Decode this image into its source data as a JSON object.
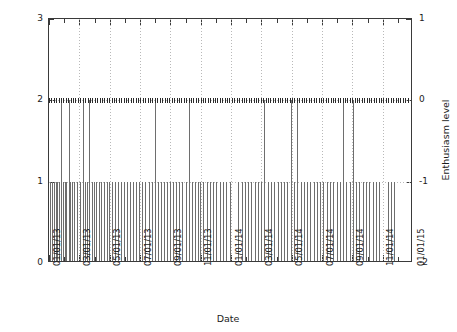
{
  "chart_data": {
    "type": "bar",
    "title": "",
    "subtitle": "",
    "xlabel": "Date",
    "ylabel": "Frequency",
    "y2label": "Enthusiasm level",
    "grid": "vertical dotted at major x ticks, dotted horizontal at y=1 and y=2",
    "legend": "none",
    "legend_position": "none",
    "xlim": [
      "01/01/13",
      "01/01/15"
    ],
    "ylim": [
      0,
      3
    ],
    "y2lim": [
      -2,
      1
    ],
    "yticks": [
      "0",
      "1",
      "2",
      "3"
    ],
    "y2ticks": [
      "-2",
      "-1",
      "0",
      "1"
    ],
    "xticks": [
      "01/01/13",
      "03/01/13",
      "05/01/13",
      "07/01/13",
      "09/01/13",
      "11/01/13",
      "01/01/14",
      "03/01/14",
      "05/01/14",
      "07/01/14",
      "09/01/14",
      "11/01/14",
      "01/01/15"
    ],
    "x_minor_tick_interval_months": 1,
    "x_major_tick_interval_months": 2,
    "series": [
      {
        "name": "Frequency",
        "style": "impulses",
        "color": "#6e6e6e",
        "note": "Vertical impulse for each dated event; height is 1 for most dates, 2 for repeat dates.",
        "x_fraction_and_value": [
          [
            0.003,
            1
          ],
          [
            0.008,
            1
          ],
          [
            0.013,
            1
          ],
          [
            0.018,
            1
          ],
          [
            0.023,
            1
          ],
          [
            0.028,
            1
          ],
          [
            0.033,
            2
          ],
          [
            0.038,
            1
          ],
          [
            0.043,
            1
          ],
          [
            0.048,
            1
          ],
          [
            0.054,
            2
          ],
          [
            0.059,
            1
          ],
          [
            0.064,
            1
          ],
          [
            0.069,
            1
          ],
          [
            0.078,
            1
          ],
          [
            0.086,
            1
          ],
          [
            0.093,
            2
          ],
          [
            0.099,
            1
          ],
          [
            0.105,
            1
          ],
          [
            0.111,
            2
          ],
          [
            0.117,
            1
          ],
          [
            0.123,
            1
          ],
          [
            0.129,
            1
          ],
          [
            0.136,
            1
          ],
          [
            0.143,
            1
          ],
          [
            0.15,
            1
          ],
          [
            0.158,
            1
          ],
          [
            0.166,
            1
          ],
          [
            0.174,
            1
          ],
          [
            0.182,
            1
          ],
          [
            0.19,
            1
          ],
          [
            0.198,
            1
          ],
          [
            0.206,
            1
          ],
          [
            0.214,
            1
          ],
          [
            0.222,
            1
          ],
          [
            0.23,
            1
          ],
          [
            0.238,
            1
          ],
          [
            0.247,
            1
          ],
          [
            0.256,
            1
          ],
          [
            0.265,
            1
          ],
          [
            0.274,
            1
          ],
          [
            0.283,
            1
          ],
          [
            0.292,
            2
          ],
          [
            0.3,
            1
          ],
          [
            0.308,
            1
          ],
          [
            0.316,
            1
          ],
          [
            0.324,
            1
          ],
          [
            0.332,
            1
          ],
          [
            0.34,
            1
          ],
          [
            0.348,
            1
          ],
          [
            0.357,
            1
          ],
          [
            0.366,
            1
          ],
          [
            0.375,
            1
          ],
          [
            0.384,
            2
          ],
          [
            0.392,
            1
          ],
          [
            0.4,
            1
          ],
          [
            0.408,
            1
          ],
          [
            0.416,
            1
          ],
          [
            0.424,
            1
          ],
          [
            0.433,
            1
          ],
          [
            0.442,
            1
          ],
          [
            0.451,
            1
          ],
          [
            0.46,
            1
          ],
          [
            0.469,
            1
          ],
          [
            0.478,
            1
          ],
          [
            0.487,
            1
          ],
          [
            0.496,
            1
          ],
          [
            0.52,
            1
          ],
          [
            0.529,
            1
          ],
          [
            0.538,
            1
          ],
          [
            0.547,
            1
          ],
          [
            0.556,
            1
          ],
          [
            0.565,
            1
          ],
          [
            0.574,
            1
          ],
          [
            0.583,
            1
          ],
          [
            0.592,
            2
          ],
          [
            0.601,
            1
          ],
          [
            0.61,
            1
          ],
          [
            0.619,
            1
          ],
          [
            0.628,
            1
          ],
          [
            0.637,
            1
          ],
          [
            0.646,
            1
          ],
          [
            0.655,
            1
          ],
          [
            0.664,
            2
          ],
          [
            0.673,
            1
          ],
          [
            0.682,
            2
          ],
          [
            0.691,
            1
          ],
          [
            0.7,
            1
          ],
          [
            0.709,
            1
          ],
          [
            0.718,
            1
          ],
          [
            0.727,
            1
          ],
          [
            0.736,
            1
          ],
          [
            0.745,
            1
          ],
          [
            0.754,
            1
          ],
          [
            0.763,
            1
          ],
          [
            0.772,
            1
          ],
          [
            0.781,
            1
          ],
          [
            0.79,
            1
          ],
          [
            0.799,
            1
          ],
          [
            0.808,
            2
          ],
          [
            0.817,
            1
          ],
          [
            0.826,
            1
          ],
          [
            0.835,
            2
          ],
          [
            0.844,
            1
          ],
          [
            0.853,
            1
          ],
          [
            0.862,
            1
          ],
          [
            0.871,
            1
          ],
          [
            0.88,
            1
          ],
          [
            0.889,
            1
          ],
          [
            0.898,
            1
          ],
          [
            0.907,
            1
          ],
          [
            0.93,
            1
          ],
          [
            0.939,
            1
          ],
          [
            0.948,
            1
          ]
        ]
      },
      {
        "name": "Enthusiasm level",
        "style": "points",
        "color": "#2b2b2b",
        "note": "Dense marker row drawn at left-axis value 2 (right-axis 0) across the whole date range."
      }
    ]
  },
  "axes": {
    "left": {
      "label": "Frequency",
      "ticks": [
        "0",
        "1",
        "2",
        "3"
      ]
    },
    "right": {
      "label": "Enthusiasm level",
      "ticks": [
        "-2",
        "-1",
        "0",
        "1"
      ]
    },
    "bottom": {
      "label": "Date"
    }
  }
}
